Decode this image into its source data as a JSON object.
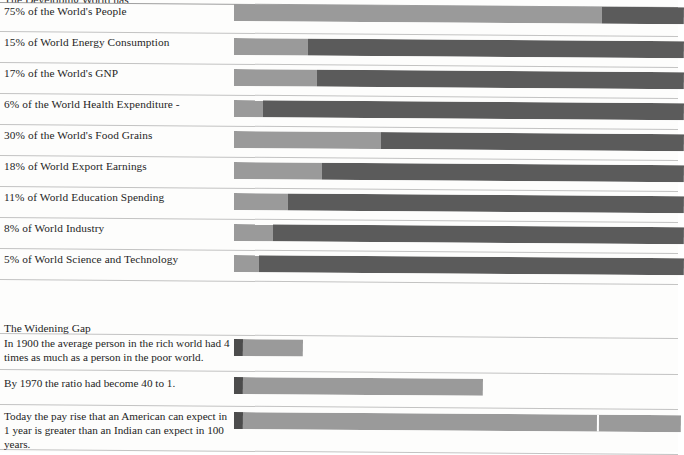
{
  "document": {
    "heading_clipped": "The Developing World has",
    "section_title": "The Widening Gap"
  },
  "chart_data": {
    "type": "bar",
    "title": "The Developing World has",
    "xlabel": "",
    "ylabel": "",
    "orientation": "horizontal",
    "stacked": true,
    "grid": false,
    "legend": false,
    "xlim": [
      0,
      100
    ],
    "units": "percent of world total",
    "series": [
      {
        "name": "Developing world share",
        "color": "#9a9a9a"
      },
      {
        "name": "Rest of world",
        "color": "#5b5b5b"
      }
    ],
    "categories": [
      "75% of the World's People",
      "15% of World Energy Consumption",
      "17% of the World's GNP",
      "6% of the World Health Expenditure -",
      "30% of the World's Food Grains",
      "18% of World Export Earnings",
      "11% of World Education Spending",
      "8% of World Industry",
      "5% of World Science and Technology"
    ],
    "values": [
      75,
      15,
      17,
      6,
      30,
      18,
      11,
      8,
      5
    ],
    "remainder": [
      25,
      85,
      83,
      94,
      70,
      82,
      89,
      92,
      95
    ]
  },
  "rows": [
    {
      "label": "75% of the World's People",
      "value": 75
    },
    {
      "label": "15% of World Energy Consumption",
      "value": 15
    },
    {
      "label": "17% of the World's GNP",
      "value": 17
    },
    {
      "label": "6% of the World Health Expenditure -",
      "value": 6
    },
    {
      "label": "30% of the World's Food Grains",
      "value": 30
    },
    {
      "label": "18% of World Export Earnings",
      "value": 18
    },
    {
      "label": "11% of World Education Spending",
      "value": 11
    },
    {
      "label": "8% of World Industry",
      "value": 8
    },
    {
      "label": "5% of World Science and Technology",
      "value": 5
    }
  ],
  "widening_gap": {
    "title": "The Widening Gap",
    "rows": [
      {
        "text": "In 1900 the average person in the rich world had 4 times as much as a person in the poor world.",
        "ratio": "4 to 1",
        "year": "1900"
      },
      {
        "text": "By 1970 the ratio had become 40 to 1.",
        "ratio": "40 to 1",
        "year": "1970"
      },
      {
        "text": "Today the pay rise that an American can expect in 1 year is greater than an Indian can expect in 100 years.",
        "ratio": "100 years",
        "year": "Today"
      }
    ]
  },
  "colors": {
    "light_gray": "#9a9a9a",
    "dark_gray": "#5b5b5b",
    "very_dark_gray": "#4c4c4c",
    "rule": "#8d8d8d",
    "paper": "#fdfdfc",
    "ink": "#242424"
  }
}
